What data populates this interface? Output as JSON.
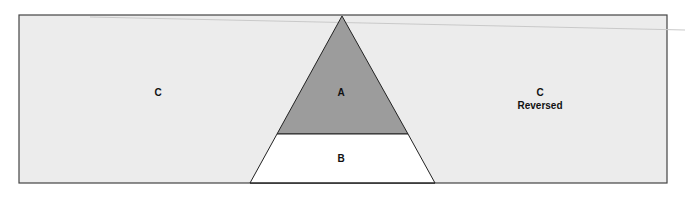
{
  "diagram": {
    "regions": {
      "left": {
        "label": "C"
      },
      "apex": {
        "label": "A"
      },
      "base": {
        "label": "B"
      },
      "right": {
        "label": "C",
        "sublabel": "Reversed"
      }
    },
    "colors": {
      "background": "#ececec",
      "apex_fill": "#9c9c9c",
      "base_fill": "#ffffff",
      "stroke": "#333333"
    }
  }
}
